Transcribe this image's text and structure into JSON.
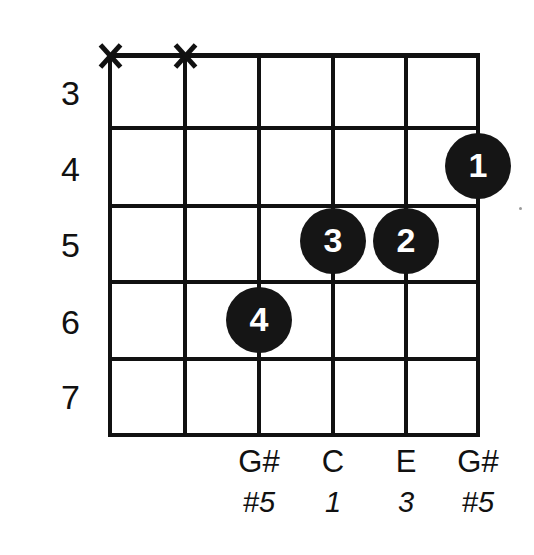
{
  "diagram": {
    "kind": "guitar-chord-diagram",
    "chord_name": "",
    "colors": {
      "background": "#ffffff",
      "ink": "#111111",
      "dot_fill": "#151515",
      "dot_text": "#ffffff"
    },
    "fret_numbers": [
      "3",
      "4",
      "5",
      "6",
      "7"
    ],
    "strings": [
      {
        "index": 1,
        "x": 110,
        "marker": "X",
        "muted": true,
        "note": "",
        "interval": "",
        "finger": ""
      },
      {
        "index": 2,
        "x": 185,
        "marker": "X",
        "muted": true,
        "note": "",
        "interval": "",
        "finger": ""
      },
      {
        "index": 3,
        "x": 259,
        "marker": "",
        "muted": false,
        "note": "G#",
        "interval": "#5",
        "finger": "4"
      },
      {
        "index": 4,
        "x": 333,
        "marker": "",
        "muted": false,
        "note": "C",
        "interval": "1",
        "finger": "3"
      },
      {
        "index": 5,
        "x": 406,
        "marker": "",
        "muted": false,
        "note": "E",
        "interval": "3",
        "finger": "2"
      },
      {
        "index": 6,
        "x": 478,
        "marker": "",
        "muted": false,
        "note": "G#",
        "interval": "#5",
        "finger": "1"
      }
    ],
    "dots": [
      {
        "finger": "1",
        "cx": 478,
        "cy": 166,
        "string": 6,
        "fret": 4
      },
      {
        "finger": "2",
        "cx": 406,
        "cy": 241,
        "string": 5,
        "fret": 5
      },
      {
        "finger": "3",
        "cx": 333,
        "cy": 241,
        "string": 4,
        "fret": 5
      },
      {
        "finger": "4",
        "cx": 259,
        "cy": 320,
        "string": 3,
        "fret": 6
      }
    ]
  }
}
